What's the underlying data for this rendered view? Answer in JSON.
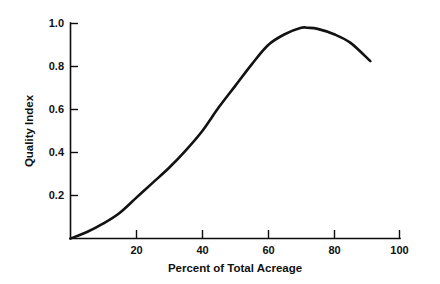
{
  "chart_data": {
    "type": "line",
    "title": "",
    "xlabel": "Percent of Total Acreage",
    "ylabel": "Quality Index",
    "xlim": [
      0,
      100
    ],
    "ylim": [
      0,
      1.0
    ],
    "grid": false,
    "legend": "none",
    "x_ticks": [
      20,
      40,
      60,
      80,
      100
    ],
    "x_tick_labels": [
      "20",
      "40",
      "60",
      "80",
      "100"
    ],
    "y_ticks": [
      0.2,
      0.4,
      0.6,
      0.8,
      1.0
    ],
    "y_tick_labels": [
      "0.2",
      "0.4",
      "0.6",
      "0.8",
      "1.0"
    ],
    "series": [
      {
        "name": "Quality Index",
        "color": "#121212",
        "x": [
          0,
          5,
          10,
          15,
          20,
          25,
          30,
          35,
          40,
          45,
          50,
          55,
          60,
          65,
          70,
          72,
          75,
          80,
          85,
          91
        ],
        "values": [
          0.0,
          0.03,
          0.07,
          0.12,
          0.19,
          0.26,
          0.33,
          0.41,
          0.5,
          0.61,
          0.71,
          0.81,
          0.9,
          0.95,
          0.98,
          0.98,
          0.975,
          0.95,
          0.91,
          0.825
        ]
      }
    ]
  },
  "labels": {
    "x_axis_title": "Percent of Total Acreage",
    "y_axis_title": "Quality Index",
    "x_tick_20": "20",
    "x_tick_40": "40",
    "x_tick_60": "60",
    "x_tick_80": "80",
    "x_tick_100": "100",
    "y_tick_02": "0.2",
    "y_tick_04": "0.4",
    "y_tick_06": "0.6",
    "y_tick_08": "0.8",
    "y_tick_10": "1.0"
  },
  "colors": {
    "background": "#ffffff",
    "axis": "#0d0d0d",
    "curve": "#121212",
    "text": "#111111"
  }
}
